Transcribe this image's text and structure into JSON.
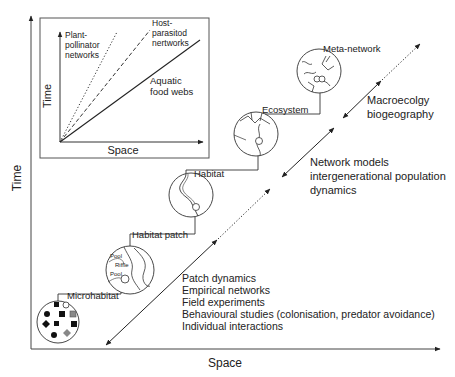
{
  "figure": {
    "outer_axes": {
      "xlabel": "Space",
      "ylabel": "Time"
    },
    "inset": {
      "xlabel": "Space",
      "ylabel": "Time",
      "lines": [
        {
          "label_line1": "Plant-",
          "label_line2": "pollinator",
          "label_line3": "networks",
          "style": "dotted"
        },
        {
          "label_line1": "Host-",
          "label_line2": "parasitod",
          "label_line3": "nertworks",
          "style": "dashed"
        },
        {
          "label_line1": "Aquatic",
          "label_line2": "food webs",
          "style": "solid"
        }
      ]
    },
    "scales": [
      {
        "label": "Microhabitat"
      },
      {
        "label": "Habitat patch",
        "sublabels": [
          "Pool",
          "Riffle",
          "Pool"
        ]
      },
      {
        "label": "Habitat"
      },
      {
        "label": "Ecosystem"
      },
      {
        "label": "Meta-network"
      }
    ],
    "approaches": {
      "large": {
        "line1": "Macroecolgy",
        "line2": "biogeography"
      },
      "intermediate": {
        "line1": "Network models",
        "line2": "intergenerational population",
        "line3": "dynamics"
      },
      "small": [
        "Patch dynamics",
        "Empirical networks",
        "Field experiments",
        "Behavioural studies (colonisation, predator avoidance)",
        "Individual interactions"
      ]
    }
  }
}
